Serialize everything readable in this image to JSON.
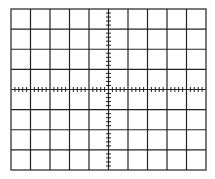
{
  "graticule": {
    "description": "Oscilloscope graticule",
    "columns": 10,
    "rows": 8,
    "minor_ticks_per_division": 5,
    "frame": {
      "x": 11,
      "y": 9,
      "width": 195,
      "height": 161
    },
    "line_color": "#222222",
    "background": "#ffffff"
  }
}
